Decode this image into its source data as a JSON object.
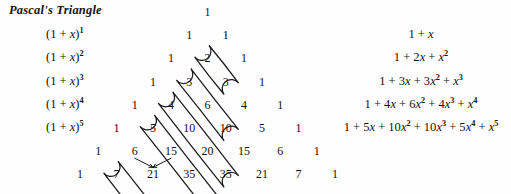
{
  "title": "Pascal's Triangle",
  "binomials": [
    {
      "label": "(1 + x)",
      "power": "1"
    },
    {
      "label": "(1 + x)",
      "power": "2"
    },
    {
      "label": "(1 + x)",
      "power": "3"
    },
    {
      "label": "(1 + x)",
      "power": "4"
    },
    {
      "label": "(1 + x)",
      "power": "5"
    }
  ],
  "chart_data": {
    "type": "table",
    "title": "Pascal's Triangle",
    "rows": [
      [
        1
      ],
      [
        1,
        1
      ],
      [
        1,
        2,
        1
      ],
      [
        1,
        3,
        3,
        1
      ],
      [
        1,
        4,
        6,
        4,
        1
      ],
      [
        1,
        5,
        10,
        10,
        5,
        1
      ],
      [
        1,
        6,
        15,
        20,
        15,
        6,
        1
      ],
      [
        1,
        7,
        21,
        35,
        35,
        21,
        7,
        1
      ]
    ],
    "row_labels": [
      "(1 + x)^0",
      "(1 + x)^1",
      "(1 + x)^2",
      "(1 + x)^3",
      "(1 + x)^4",
      "(1 + x)^5",
      "(1 + x)^6",
      "(1 + x)^7"
    ],
    "expansions": [
      "1 + x",
      "1 + 2x + x^2",
      "1 + 3x + 3x^2 + x^3",
      "1 + 4x + 6x^2 + 4x^3 + x^4",
      "1 + 5x + 10x^2 + 10x^3 + 5x^4 + x^5"
    ],
    "highlighted_diagonals": [
      {
        "row_start": 1,
        "k": 1,
        "values": [
          1
        ]
      },
      {
        "row_start": 2,
        "k": 1,
        "values": [
          2,
          1
        ]
      },
      {
        "row_start": 3,
        "k": 1,
        "values": [
          3,
          3,
          1
        ]
      },
      {
        "row_start": 4,
        "k": 1,
        "values": [
          4,
          6,
          4,
          1
        ]
      },
      {
        "row_start": 5,
        "k": 1,
        "values": [
          5,
          10,
          10,
          5,
          1
        ]
      },
      {
        "row_start": 7,
        "k": 1,
        "values": [
          7,
          21,
          35,
          35,
          21,
          7,
          1
        ]
      }
    ],
    "addition_arrows": [
      {
        "from": 6,
        "to": 21
      },
      {
        "from": 15,
        "to": 21
      }
    ],
    "xlabel": "",
    "ylabel": "",
    "grid": false
  },
  "expansion_rows": [
    {
      "id": "e1",
      "parts": [
        {
          "t": "1 + "
        },
        {
          "t": "x",
          "i": true
        }
      ]
    },
    {
      "id": "e2",
      "parts": [
        {
          "t": "1 + 2"
        },
        {
          "t": "x",
          "i": true
        },
        {
          "t": " + "
        },
        {
          "t": "x",
          "i": true,
          "sup": "2"
        }
      ]
    },
    {
      "id": "e3",
      "parts": [
        {
          "t": "1 + 3"
        },
        {
          "t": "x",
          "i": true
        },
        {
          "t": " + 3"
        },
        {
          "t": "x",
          "i": true,
          "sup": "2"
        },
        {
          "t": " + "
        },
        {
          "t": "x",
          "i": true,
          "sup": "3"
        }
      ]
    },
    {
      "id": "e4",
      "parts": [
        {
          "t": "1 + 4"
        },
        {
          "t": "x",
          "i": true
        },
        {
          "t": " + 6"
        },
        {
          "t": "x",
          "i": true,
          "sup": "2"
        },
        {
          "t": " + 4"
        },
        {
          "t": "x",
          "i": true,
          "sup": "3"
        },
        {
          "t": " + "
        },
        {
          "t": "x",
          "i": true,
          "sup": "4"
        }
      ]
    },
    {
      "id": "e5",
      "parts": [
        {
          "t": "1 + 5"
        },
        {
          "t": "x",
          "i": true
        },
        {
          "t": " + 10"
        },
        {
          "t": "x",
          "i": true,
          "sup": "2"
        },
        {
          "t": " + 10"
        },
        {
          "t": "x",
          "i": true,
          "sup": "3"
        },
        {
          "t": " + 5"
        },
        {
          "t": "x",
          "i": true,
          "sup": "4"
        },
        {
          "t": " + "
        },
        {
          "t": "x",
          "i": true,
          "sup": "5"
        }
      ]
    }
  ],
  "colors": {
    "ink": "#15120f",
    "background": "#fefefe",
    "annotation": "#1a1a1a"
  }
}
